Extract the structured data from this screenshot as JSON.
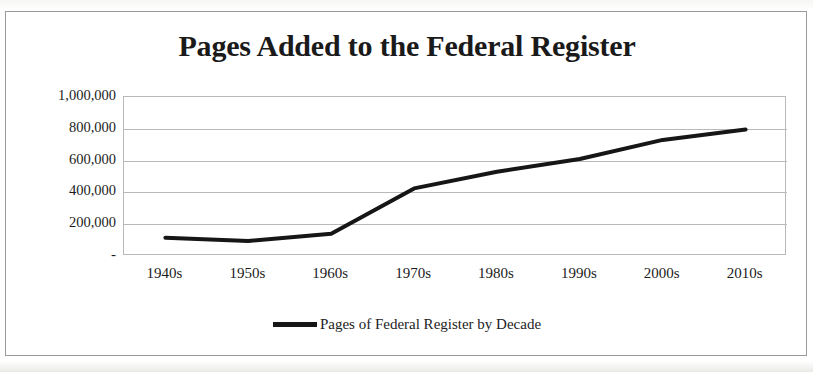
{
  "chart_data": {
    "type": "line",
    "title": "Pages Added to the Federal Register",
    "xlabel": "",
    "ylabel": "",
    "categories": [
      "1940s",
      "1950s",
      "1960s",
      "1970s",
      "1980s",
      "1990s",
      "2000s",
      "2010s"
    ],
    "series": [
      {
        "name": "Pages of Federal Register by Decade",
        "color": "#161616",
        "values": [
          115000,
          95000,
          140000,
          425000,
          530000,
          610000,
          730000,
          795000
        ]
      }
    ],
    "ylim": [
      0,
      1000000
    ],
    "ytick_values": [
      1000000,
      800000,
      600000,
      400000,
      200000,
      0
    ],
    "ytick_labels": [
      "1,000,000",
      "800,000",
      "600,000",
      "400,000",
      "200,000",
      "-"
    ],
    "grid": true,
    "grid_axis": "y",
    "legend": true,
    "legend_position": "bottom",
    "legend_entries": [
      "Pages of Federal Register by Decade"
    ],
    "line_width": 4,
    "markers": false
  },
  "frame": {
    "border_color": "#9a9a9a",
    "background": "#ffffff"
  },
  "axis": {
    "grid_color": "#b9b9b9",
    "plot_border_color": "#b9b9b9",
    "tick_label_color": "#1c1c1c"
  }
}
